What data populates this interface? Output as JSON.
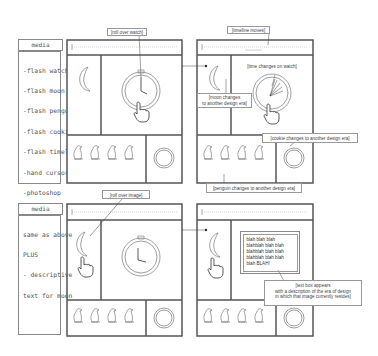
{
  "storyboard_1": {
    "media_label": "media",
    "media_items": [
      "-flash watch",
      "-flash moon",
      "-flash penguin",
      "-flash cookie",
      "-flash timeline",
      "-hand cursor",
      "-photoshop",
      "  layout"
    ],
    "left_frame": {
      "callout": "[roll over watch]"
    },
    "right_frame": {
      "callout_timeline": "[timeline moves]",
      "callout_watch": "[time changes on watch]",
      "callout_moon_line1": "[moon changes",
      "callout_moon_line2": "to another design era]",
      "callout_cookie": "[cookie changes to another design era]",
      "callout_penguin": "[penguin changes to another design era]"
    }
  },
  "storyboard_2": {
    "media_label": "media",
    "media_items": [
      "same as above",
      "PLUS",
      "- descriptive",
      "text for moon"
    ],
    "left_frame": {
      "callout": "[roll over image]"
    },
    "right_frame": {
      "text_box_lines": [
        "blah blah blah",
        "blahblah blah blah",
        "blahblah blah blah",
        "blahblah blah blah",
        "blah BLAH!"
      ],
      "callout_line1": "[text box appears",
      "callout_line2": "with a description of the era of design",
      "callout_line3": "in which that image currently resides]"
    }
  },
  "colors": {
    "frame_stroke": "#555555",
    "light_stroke": "#888888",
    "background": "#ffffff"
  }
}
